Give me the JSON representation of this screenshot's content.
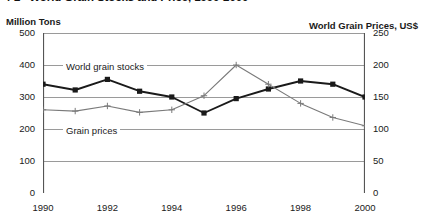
{
  "figure": {
    "number": "4-2",
    "title": "World Grain Stocks and Price, 1990-2000"
  },
  "axis_titles": {
    "left": "Million Tons",
    "right": "World Grain Prices, US$"
  },
  "annotations": {
    "stocks": "World grain stocks",
    "prices": "Grain prices"
  },
  "colors": {
    "stocks_line": "#1a1a1a",
    "prices_line": "#7a7a7a",
    "gridline": "#9a9a9a",
    "axis": "#555555",
    "background": "#ffffff"
  },
  "chart_data": {
    "type": "line",
    "xlabel": "",
    "ylabel": "Million Tons",
    "y2label": "World Grain Prices, US$",
    "grid": true,
    "legend_position": "inline-annotations",
    "x": [
      1990,
      1991,
      1992,
      1993,
      1994,
      1995,
      1996,
      1997,
      1998,
      1999,
      2000
    ],
    "xticks_major": [
      1990,
      1992,
      1994,
      1996,
      1998,
      2000
    ],
    "xtick_labels": [
      "1990",
      "1992",
      "1994",
      "1996",
      "1998",
      "2000"
    ],
    "xlim": [
      1990,
      2000
    ],
    "ylim": [
      0,
      500
    ],
    "yticks": [
      0,
      100,
      200,
      300,
      400,
      500
    ],
    "ytick_labels": [
      "0",
      "100",
      "200",
      "300",
      "400",
      "500"
    ],
    "y2lim": [
      0,
      250
    ],
    "y2ticks": [
      0,
      50,
      100,
      150,
      200,
      250
    ],
    "y2tick_labels": [
      "0",
      "50",
      "100",
      "150",
      "200",
      "250"
    ],
    "series": [
      {
        "name": "World grain stocks",
        "axis": "left",
        "marker": "square",
        "values": [
          340,
          322,
          355,
          318,
          300,
          250,
          295,
          325,
          350,
          340,
          300
        ]
      },
      {
        "name": "Grain prices",
        "axis": "right",
        "marker": "plus",
        "values": [
          130,
          128,
          136,
          126,
          130,
          152,
          200,
          170,
          140,
          118,
          105
        ]
      }
    ]
  }
}
